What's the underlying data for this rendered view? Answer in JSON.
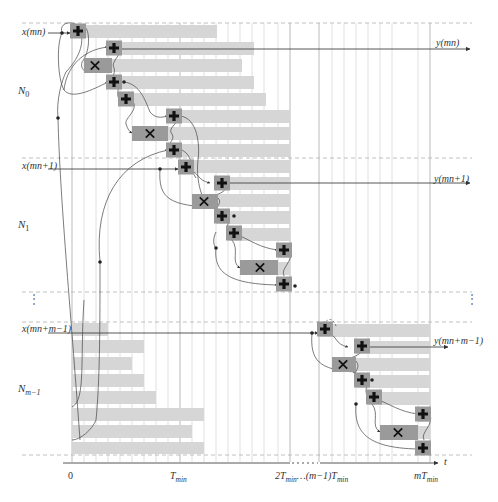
{
  "diagram": {
    "title": "",
    "groups": [
      {
        "label": "N",
        "sub": "0",
        "input_label": "x(mn)",
        "output_label": "y(mn)"
      },
      {
        "label": "N",
        "sub": "1",
        "input_label": "x(mn+1)",
        "output_label": "y(mn+1)"
      },
      {
        "label": "N",
        "sub": "m−1",
        "input_label": "x(mn+m−1)",
        "output_label": "y(mn+m−1)"
      }
    ],
    "ellipsis_left": "⋮",
    "ellipsis_right": "⋮",
    "axis": {
      "variable": "t",
      "ticks": [
        {
          "label": "0"
        },
        {
          "label": "T",
          "sub": "min"
        },
        {
          "label": "2T",
          "sub": "min",
          "tail": "…(m−1)T",
          "tail_sub": "min"
        },
        {
          "label": "mT",
          "sub": "min"
        }
      ]
    },
    "symbols": {
      "adder": "plus-icon",
      "multiplier": "times-icon"
    },
    "colors": {
      "bar": "#d6d6d6",
      "operator_block": "#9a9a9a",
      "wire": "#444444",
      "grid": "#d8d8d8",
      "dashed": "#b0b0b0"
    }
  }
}
